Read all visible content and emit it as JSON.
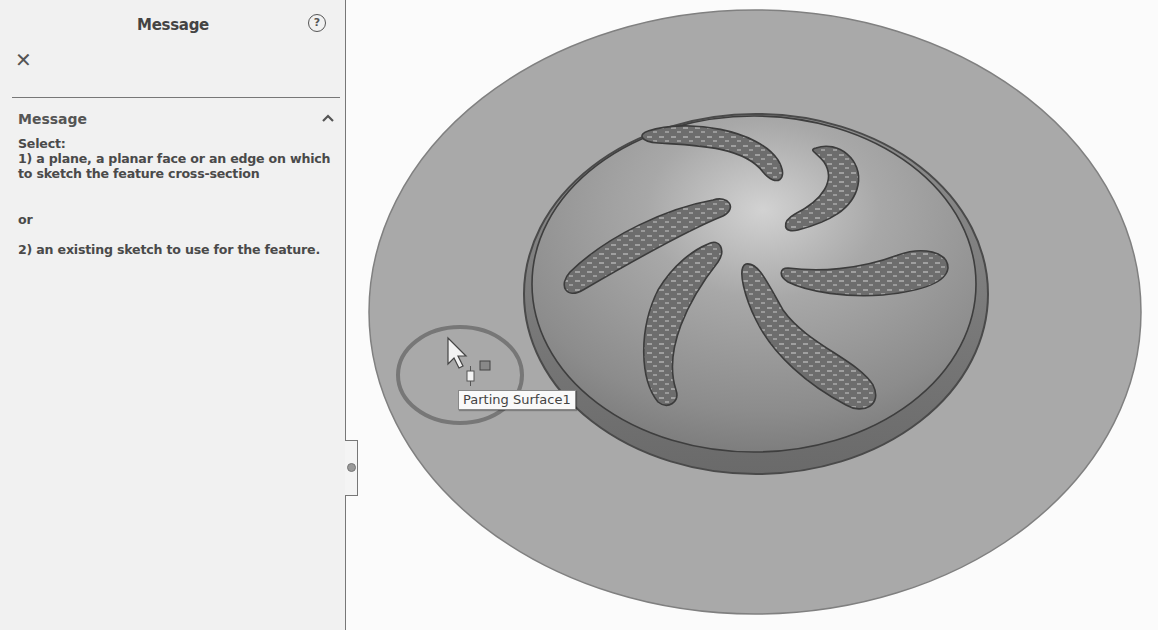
{
  "panel": {
    "title": "Message",
    "help_icon": "question-circle-icon",
    "close_icon": "close-x-icon",
    "section": {
      "label": "Message",
      "collapse_icon": "chevron-up-icon"
    },
    "message": {
      "line1": "Select:",
      "line2": "1) a plane, a planar face or an edge on which to sketch the feature cross-section",
      "line3": "or",
      "line4": "2) an existing sketch to use for the feature."
    }
  },
  "viewport": {
    "tooltip": "Parting Surface1",
    "cursor_icon": "arrow-pointer-icon",
    "selection_filter_icon": "face-select-icon",
    "colors": {
      "parting_surface": "#a9a9a9",
      "dome": "#9a9a9a",
      "slot": "#6f6f6f",
      "highlight_circle": "#7a7a7a",
      "outline": "#555555"
    }
  }
}
